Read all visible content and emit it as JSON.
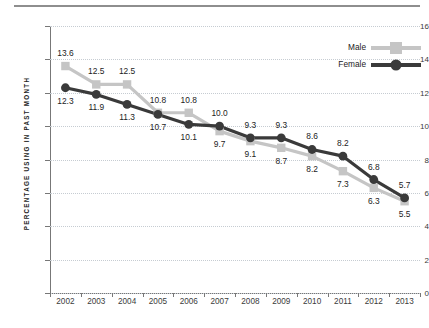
{
  "chart_data": {
    "type": "line",
    "title": "",
    "subtitle": "",
    "xlabel": "",
    "ylabel": "PERCENTAGE USING IN PAST MONTH",
    "categories": [
      "2002",
      "2003",
      "2004",
      "2005",
      "2006",
      "2007",
      "2008",
      "2009",
      "2010",
      "2011",
      "2012",
      "2013"
    ],
    "ylim": [
      0,
      16
    ],
    "ytick_step": 2,
    "yticks": [
      "0",
      "2",
      "4",
      "6",
      "8",
      "10",
      "12",
      "14",
      "16"
    ],
    "grid": true,
    "legend_position": "top-right",
    "series": [
      {
        "name": "Male",
        "color": "#c5c5c5",
        "marker": "square",
        "values": [
          13.6,
          12.5,
          12.5,
          10.8,
          10.8,
          9.7,
          9.1,
          8.7,
          8.2,
          7.3,
          6.3,
          5.5
        ],
        "labels": [
          "13.6",
          "12.5",
          "12.5",
          "10.8",
          "10.8",
          "9.7",
          "9.1",
          "8.7",
          "8.2",
          "7.3",
          "6.3",
          "5.5"
        ]
      },
      {
        "name": "Female",
        "color": "#3a3a3a",
        "marker": "circle",
        "values": [
          12.3,
          11.9,
          11.3,
          10.7,
          10.1,
          10.0,
          9.3,
          9.3,
          8.6,
          8.2,
          6.8,
          5.7
        ],
        "labels": [
          "12.3",
          "11.9",
          "11.3",
          "10.7",
          "10.1",
          "10.0",
          "9.3",
          "9.3",
          "8.6",
          "8.2",
          "6.8",
          "5.7"
        ]
      }
    ]
  },
  "legend": {
    "items": [
      {
        "label": "Male"
      },
      {
        "label": "Female"
      }
    ]
  },
  "colors": {
    "male": "#c5c5c5",
    "female": "#3a3a3a",
    "grid": "#c6ccd2",
    "axis": "#777777",
    "rule": "#8e8e8e",
    "text": "#1c1c1c"
  }
}
